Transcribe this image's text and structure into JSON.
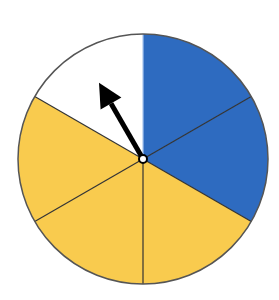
{
  "spinner": {
    "center": [
      143,
      159
    ],
    "radius": 125,
    "sector_count": 6,
    "sectors": [
      {
        "index": 0,
        "start_deg": 0,
        "end_deg": 60,
        "color": "blue",
        "fill": "#2E6BC0",
        "divider": "#A9C6EE"
      },
      {
        "index": 1,
        "start_deg": 60,
        "end_deg": 120,
        "color": "blue",
        "fill": "#2E6BC0",
        "divider": "#333333"
      },
      {
        "index": 2,
        "start_deg": 120,
        "end_deg": 180,
        "color": "yellow",
        "fill": "#F9CB4E",
        "divider": "#333333"
      },
      {
        "index": 3,
        "start_deg": 180,
        "end_deg": 240,
        "color": "yellow",
        "fill": "#F9CB4E",
        "divider": "#333333"
      },
      {
        "index": 4,
        "start_deg": 240,
        "end_deg": 300,
        "color": "yellow",
        "fill": "#F9CB4E",
        "divider": "#333333"
      },
      {
        "index": 5,
        "start_deg": 300,
        "end_deg": 360,
        "color": "white",
        "fill": "#FFFFFF",
        "divider": "#333333"
      }
    ],
    "arrow": {
      "points_to": "white",
      "angle_deg": 330,
      "color": "#000000"
    },
    "outline_color": "#555555"
  }
}
